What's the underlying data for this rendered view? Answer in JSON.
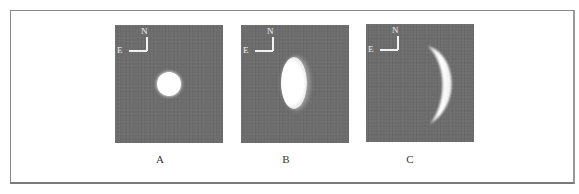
{
  "figure": {
    "compass": {
      "north": "N",
      "east": "E"
    },
    "panels": [
      {
        "id": "A",
        "label": "A",
        "phase": "full"
      },
      {
        "id": "B",
        "label": "B",
        "phase": "gibbous"
      },
      {
        "id": "C",
        "label": "C",
        "phase": "crescent"
      }
    ]
  },
  "colors": {
    "panel_background": "#6b6b6b",
    "planet": "#ffffff",
    "frame_border": "#8a8a8a"
  }
}
